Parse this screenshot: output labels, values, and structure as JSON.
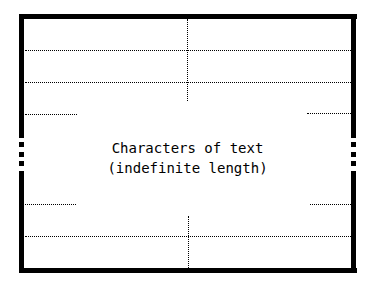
{
  "diagram": {
    "body_text": {
      "line1": "Characters of text",
      "line2": "(indefinite length)"
    },
    "colors": {
      "stroke": "#000000",
      "background": "#ffffff"
    }
  }
}
